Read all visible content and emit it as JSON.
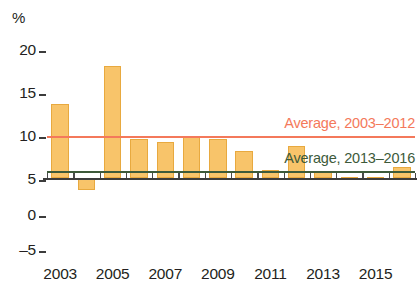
{
  "chart_data": {
    "type": "bar",
    "title": "",
    "subtitle": "",
    "xlabel": "",
    "ylabel": "%",
    "unit_label": "%",
    "ylim": [
      -5,
      20
    ],
    "yticks": [
      20,
      15,
      10,
      5,
      0,
      -5
    ],
    "ytick_labels": [
      "20",
      "15",
      "10",
      "5",
      "0",
      "–5"
    ],
    "grid": false,
    "legend_position": "inline-right",
    "categories": [
      2003,
      2004,
      2005,
      2006,
      2007,
      2008,
      2009,
      2010,
      2011,
      2012,
      2013,
      2014,
      2015,
      2016
    ],
    "xtick_labels": [
      "2003",
      "2005",
      "2007",
      "2009",
      "2011",
      "2013",
      "2015"
    ],
    "xtick_label_years": [
      2003,
      2005,
      2007,
      2009,
      2011,
      2013,
      2015
    ],
    "series": [
      {
        "name": "Annual value",
        "color": "#f8c46a",
        "edge_color": "#e8a93f",
        "values": [
          10.0,
          -1.6,
          15.1,
          5.3,
          4.8,
          5.7,
          5.3,
          3.7,
          1.1,
          4.3,
          0.9,
          0.15,
          0.1,
          1.5
        ]
      }
    ],
    "reference_lines": [
      {
        "name": "average-2003-2012",
        "label": "Average, 2003–2012",
        "value": 5.5,
        "color": "#f4795b",
        "label_color": "#f4795b",
        "span_years": [
          2003,
          2016
        ]
      },
      {
        "name": "average-2013-2016",
        "label": "Average, 2013–2016",
        "value": 0.75,
        "color": "#3d5a3a",
        "label_color": "#3d5a3a",
        "span_years": [
          2003,
          2016
        ]
      }
    ]
  }
}
